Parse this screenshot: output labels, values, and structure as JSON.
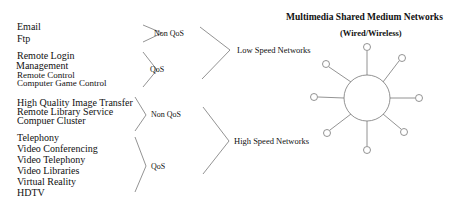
{
  "title": "Multimedia Shared Medium Networks",
  "subtitle": "(Wired/Wireless)",
  "groups": [
    {
      "applications": [
        "Email",
        "Ftp"
      ],
      "qos_class": "Non QoS",
      "network": "Low Speed Networks"
    },
    {
      "applications": [
        "Remote Login",
        "Management",
        "Remote Control",
        "Computer Game Control"
      ],
      "qos_class": "QoS",
      "network": "Low Speed Networks"
    },
    {
      "applications": [
        "High Quality Image Transfer",
        "Remote Library Service",
        "Compuer Cluster"
      ],
      "qos_class": "Non QoS",
      "network": "High Speed Networks"
    },
    {
      "applications": [
        "Telephony",
        "Video Conferencing",
        "Video Telephony",
        "Video Libraries",
        "Virtual Reality",
        "HDTV"
      ],
      "qos_class": "QoS",
      "network": "High Speed Networks"
    }
  ],
  "networks": {
    "low": "Low Speed Networks",
    "high": "High Speed Networks"
  },
  "topology": {
    "type": "shared-medium-star",
    "node_count": 8,
    "line_color": "#777777"
  }
}
